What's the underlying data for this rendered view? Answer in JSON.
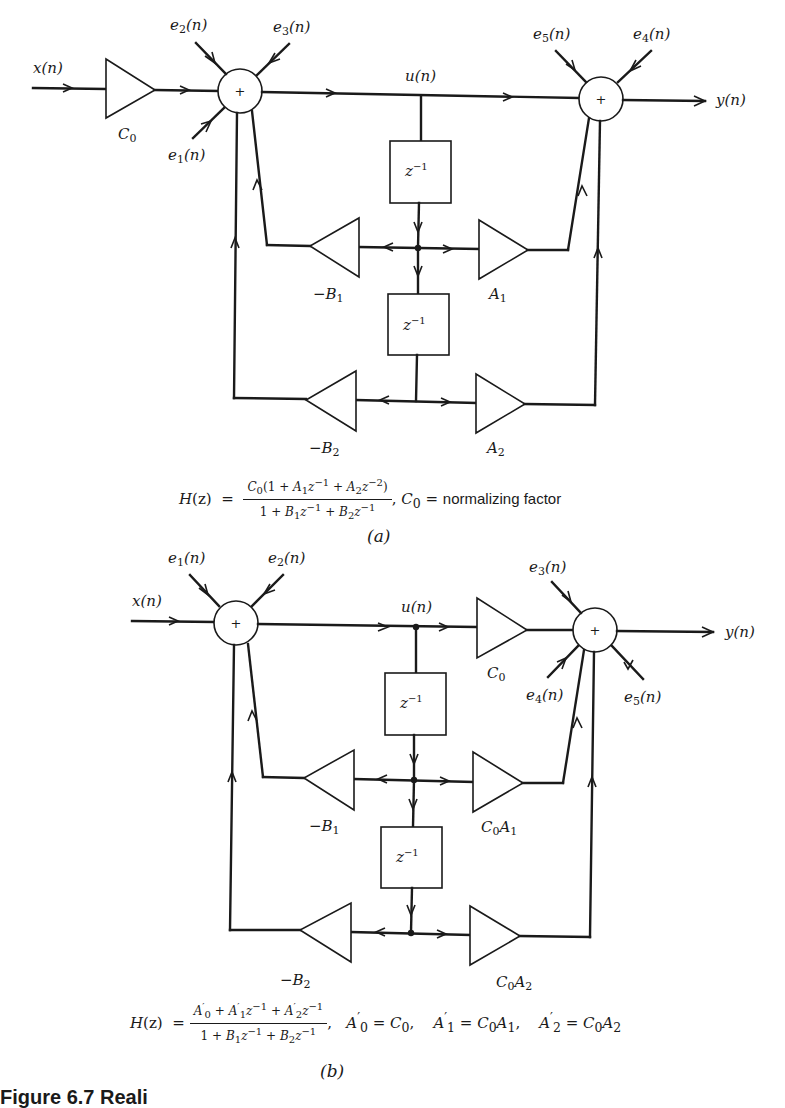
{
  "figure": {
    "caption_prefix": "Figure 6.7 Reali",
    "panels": [
      {
        "id": "a",
        "caption": "(a)",
        "input_label": "x(n)",
        "output_label": "y(n)",
        "state_label": "u(n)",
        "input_gain": "C0",
        "summer_symbol": "+",
        "delay_label": "z^-1",
        "noise_inputs": [
          "e1(n)",
          "e2(n)",
          "e3(n)",
          "e4(n)",
          "e5(n)"
        ],
        "feedback_gains": [
          "-B1",
          "-B2"
        ],
        "feedforward_gains": [
          "A1",
          "A2"
        ],
        "transfer_function": {
          "lhs": "H(z) =",
          "numerator": "C0(1 + A1z^-1 + A2z^-2)",
          "denominator": "1 + B1z^-1 + B2z^-1",
          "note": ", C0 = normalizing factor"
        }
      },
      {
        "id": "b",
        "caption": "(b)",
        "input_label": "x(n)",
        "output_label": "y(n)",
        "state_label": "u(n)",
        "output_gain": "C0",
        "summer_symbol": "+",
        "delay_label": "z^-1",
        "noise_inputs": [
          "e1(n)",
          "e2(n)",
          "e3(n)",
          "e4(n)",
          "e5(n)"
        ],
        "feedback_gains": [
          "-B1",
          "-B2"
        ],
        "feedforward_gains": [
          "C0A1",
          "C0A2"
        ],
        "transfer_function": {
          "lhs": "H(z) =",
          "numerator": "A'0 + A'1z^-1 + A'2z^-1",
          "denominator": "1 + B1z^-1 + B2z^-1",
          "relations": [
            "A'0 = C0,",
            "A'1 = C0A1,",
            "A'2 = C0A2"
          ]
        }
      }
    ]
  },
  "render": {
    "a": {
      "x": "x",
      "n": "(n)",
      "y": "y",
      "u": "u",
      "C": "C",
      "zero": "0",
      "e": "e",
      "one": "1",
      "two": "2",
      "three": "3",
      "four": "4",
      "five": "5",
      "z": "z",
      "minus1": "−1",
      "minus2": "−2",
      "B": "B",
      "A": "A",
      "neg": "−",
      "plus": "+",
      "H": "H",
      "zarg": "(z)",
      "eq": "=",
      "num_open": "(1",
      "sum": "+",
      "close": ")",
      "normalizing": "normalizing factor",
      "comma": ",",
      "caption": "(a)"
    },
    "b": {
      "prime": "′",
      "caption": "(b)",
      "rel0": "=",
      "rel1": "=",
      "rel2": "="
    }
  }
}
